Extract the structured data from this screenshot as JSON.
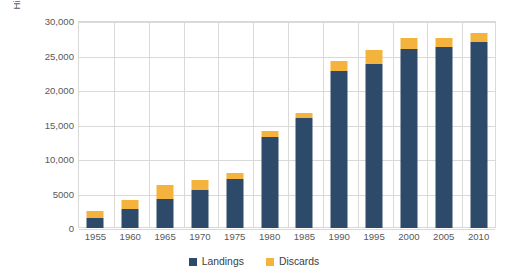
{
  "chart_data": {
    "type": "bar",
    "subtype": "stacked-vertical",
    "title": "",
    "xlabel": "",
    "ylabel": "High seas catch (x1000) tons per 5 years",
    "categories": [
      "1955",
      "1960",
      "1965",
      "1970",
      "1975",
      "1980",
      "1985",
      "1990",
      "1995",
      "2000",
      "2005",
      "2010"
    ],
    "series": [
      {
        "name": "Landings",
        "color": "#2e4a6b",
        "values": [
          1400,
          2800,
          4200,
          5500,
          7100,
          13200,
          16000,
          22800,
          23800,
          26000,
          26300,
          27000
        ]
      },
      {
        "name": "Discards",
        "color": "#f3b33d",
        "values": [
          1000,
          1300,
          2000,
          1400,
          900,
          800,
          600,
          1400,
          2000,
          1600,
          1200,
          1300
        ]
      }
    ],
    "totals": [
      2400,
      4100,
      6200,
      6900,
      8000,
      14000,
      16600,
      24200,
      25800,
      27600,
      27500,
      28300
    ],
    "ylim": [
      0,
      30000
    ],
    "ytick_values": [
      0,
      5000,
      10000,
      15000,
      20000,
      25000,
      30000
    ],
    "ytick_labels": [
      "0",
      "5000",
      "10,000",
      "15,000",
      "20,000",
      "25,000",
      "30,000"
    ],
    "grid": {
      "horizontal": true,
      "vertical": true
    },
    "legend": {
      "position": "bottom-center"
    },
    "plot_border_color": "#d9d9d9",
    "gridline_color": "#d9d9d9",
    "background": "#ffffff"
  },
  "legend_entries": [
    {
      "label": "Landings",
      "color": "#2e4a6b"
    },
    {
      "label": "Discards",
      "color": "#f3b33d"
    }
  ]
}
